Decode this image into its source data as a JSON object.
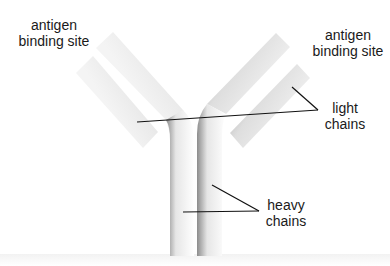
{
  "diagram": {
    "labels": {
      "antigen_left": {
        "line1": "antigen",
        "line2": "binding site"
      },
      "antigen_right": {
        "line1": "antigen",
        "line2": "binding site"
      },
      "light_chains": {
        "line1": "light",
        "line2": "chains"
      },
      "heavy_chains": {
        "line1": "heavy",
        "line2": "chains"
      }
    },
    "colors": {
      "chain_light": "#f4f4f4",
      "chain_dark": "#8a8a8a",
      "leader_line": "#111111",
      "text": "#1a1a1a"
    }
  }
}
